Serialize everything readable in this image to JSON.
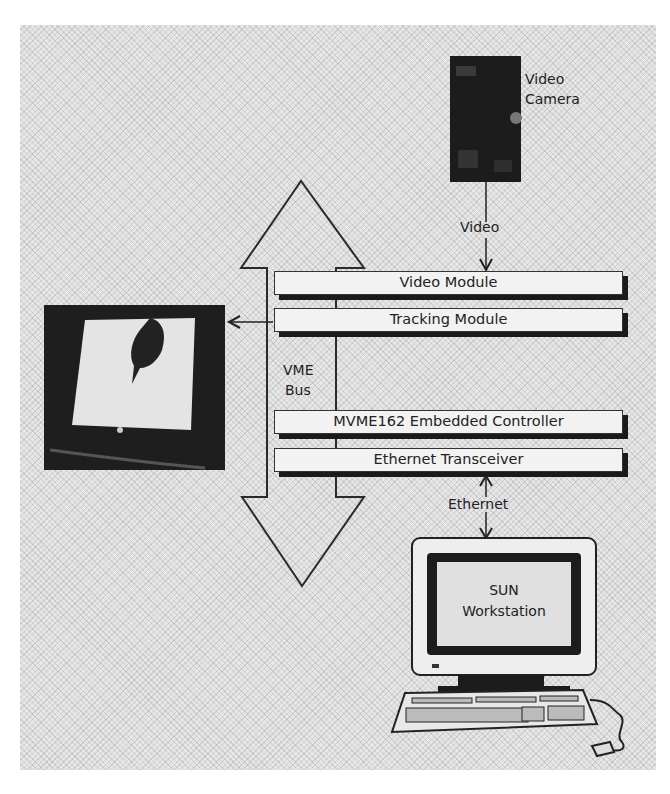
{
  "figure": {
    "type": "system-architecture-diagram",
    "components": {
      "camera": {
        "label_line1": "Video",
        "label_line2": "Camera",
        "icon": "video-camera-photo"
      },
      "video_link": {
        "label": "Video"
      },
      "bus": {
        "label_line1": "VME",
        "label_line2": "Bus",
        "icon": "bidirectional-arrow"
      },
      "modules": [
        {
          "id": "video-module",
          "label": "Video Module"
        },
        {
          "id": "tracking-module",
          "label": "Tracking Module"
        },
        {
          "id": "mvme162-controller",
          "label": "MVME162 Embedded Controller"
        },
        {
          "id": "ethernet-transceiver",
          "label": "Ethernet Transceiver"
        }
      ],
      "monitor": {
        "icon": "tv-monitor-with-hand-photo"
      },
      "ethernet_link": {
        "label": "Ethernet"
      },
      "workstation": {
        "label_line1": "SUN",
        "label_line2": "Workstation",
        "icon": "computer-workstation"
      }
    },
    "connections": [
      {
        "from": "Video Camera",
        "to": "Video Module",
        "label": "Video",
        "direction": "down"
      },
      {
        "from": "Tracking Module",
        "to": "Monitor",
        "label": "",
        "direction": "left"
      },
      {
        "from": "Ethernet Transceiver",
        "to": "SUN Workstation",
        "label": "Ethernet",
        "direction": "bidirectional"
      }
    ],
    "colors": {
      "background": "#e6e6e6",
      "stroke": "#222222",
      "bar_fill": "#f2f2f2",
      "shadow": "#1a1a1a"
    }
  }
}
